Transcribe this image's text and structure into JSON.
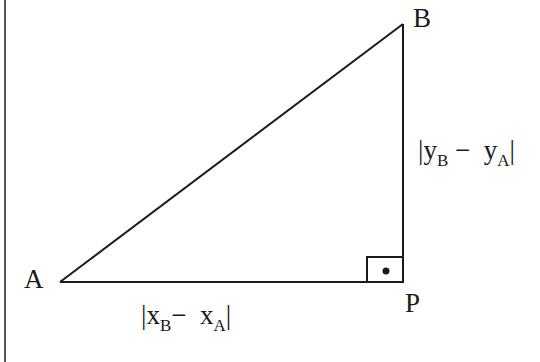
{
  "diagram": {
    "title": "",
    "type": "right-triangle-distance",
    "stroke_color": "#1a1a1a",
    "border_color": "#555555",
    "vertices": {
      "A": {
        "label": "A",
        "x": 60,
        "y": 282
      },
      "B": {
        "label": "B",
        "x": 403,
        "y": 24
      },
      "P": {
        "label": "P",
        "x": 403,
        "y": 282
      }
    },
    "right_angle_marker": {
      "at": "P",
      "size": 36,
      "dot": true
    },
    "edges": [
      {
        "from": "A",
        "to": "B",
        "label": ""
      },
      {
        "from": "A",
        "to": "P",
        "label": "|xB − xA|"
      },
      {
        "from": "P",
        "to": "B",
        "label": "|yB − yA|"
      }
    ],
    "labels": {
      "A": "A",
      "B": "B",
      "P": "P",
      "horizontal": {
        "bar_left": "|",
        "var1": "x",
        "sub1": "B",
        "minus": "−",
        "var2": "x",
        "sub2": "A",
        "bar_right": "|"
      },
      "vertical": {
        "bar_left": "|",
        "var1": "y",
        "sub1": "B",
        "minus": "−",
        "var2": "y",
        "sub2": "A",
        "bar_right": "|"
      }
    }
  }
}
